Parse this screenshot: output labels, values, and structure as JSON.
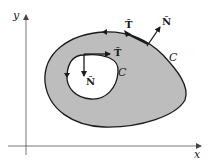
{
  "diagram": {
    "type": "region-with-hole",
    "colors": {
      "region_fill": "#bdbdbd",
      "stroke": "#1a1a1a",
      "axis": "#555555",
      "background": "#ffffff"
    },
    "axes": {
      "x_label": "x",
      "y_label": "y"
    },
    "outer_curve": {
      "label": "C",
      "tangent_label": "T̂",
      "normal_label": "N̂",
      "orientation": "counterclockwise"
    },
    "inner_curve": {
      "label": "C",
      "tangent_label": "T̂",
      "normal_label": "N̂",
      "orientation": "clockwise"
    }
  }
}
